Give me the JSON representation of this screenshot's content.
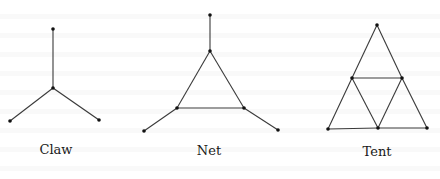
{
  "figure": {
    "graphs": [
      {
        "name": "Claw",
        "label": "Claw",
        "label_pos": [
          56,
          142
        ],
        "vertices": [
          [
            53,
            29
          ],
          [
            53,
            88
          ],
          [
            10,
            121
          ],
          [
            99,
            120
          ]
        ],
        "edges": [
          [
            0,
            1
          ],
          [
            1,
            2
          ],
          [
            1,
            3
          ]
        ]
      },
      {
        "name": "Net",
        "label": "Net",
        "label_pos": [
          209,
          143
        ],
        "vertices": [
          [
            210,
            15
          ],
          [
            210,
            51
          ],
          [
            177,
            108
          ],
          [
            244,
            108
          ],
          [
            144,
            131
          ],
          [
            278,
            130
          ]
        ],
        "edges": [
          [
            0,
            1
          ],
          [
            1,
            2
          ],
          [
            1,
            3
          ],
          [
            2,
            3
          ],
          [
            2,
            4
          ],
          [
            3,
            5
          ]
        ]
      },
      {
        "name": "Tent",
        "label": "Tent",
        "label_pos": [
          377,
          144
        ],
        "vertices": [
          [
            377,
            25
          ],
          [
            352,
            78
          ],
          [
            402,
            78
          ],
          [
            328,
            129
          ],
          [
            378,
            128
          ],
          [
            427,
            128
          ]
        ],
        "edges": [
          [
            0,
            1
          ],
          [
            0,
            2
          ],
          [
            1,
            2
          ],
          [
            1,
            3
          ],
          [
            1,
            4
          ],
          [
            2,
            4
          ],
          [
            2,
            5
          ],
          [
            3,
            4
          ],
          [
            4,
            5
          ]
        ]
      }
    ],
    "colors": {
      "edge": "#3a3a3a",
      "vertex": "#111111",
      "background": "#ffffff"
    }
  }
}
